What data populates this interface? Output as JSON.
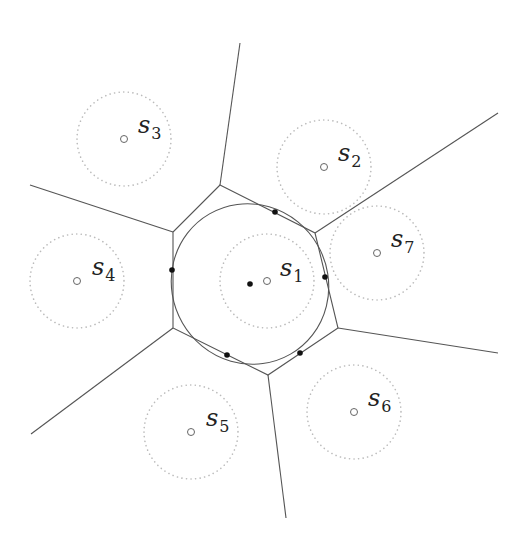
{
  "diagram": {
    "type": "voronoi-cell-with-inscribed-ellipse",
    "colors": {
      "edge": "#555555",
      "dotted_circle": "#bbbbbb",
      "site": "#666666",
      "tangent_point": "#111111"
    },
    "hexagon_vertices": [
      [
        220,
        185
      ],
      [
        315,
        233
      ],
      [
        338,
        328
      ],
      [
        268,
        375
      ],
      [
        173,
        328
      ],
      [
        173,
        232
      ]
    ],
    "rays": [
      {
        "from": [
          220,
          185
        ],
        "to": [
          240,
          43
        ]
      },
      {
        "from": [
          315,
          233
        ],
        "to": [
          498,
          113
        ]
      },
      {
        "from": [
          338,
          328
        ],
        "to": [
          498,
          353
        ]
      },
      {
        "from": [
          268,
          375
        ],
        "to": [
          286,
          518
        ]
      },
      {
        "from": [
          173,
          328
        ],
        "to": [
          31,
          434
        ]
      },
      {
        "from": [
          173,
          232
        ],
        "to": [
          30,
          185
        ]
      }
    ],
    "inscribed_ellipse": {
      "cx": 250,
      "cy": 284,
      "rx": 78,
      "ry": 81,
      "rotate": -30
    },
    "center_point": [
      250,
      284
    ],
    "tangent_points": [
      [
        275,
        212
      ],
      [
        172,
        270
      ],
      [
        325,
        277
      ],
      [
        227,
        355
      ],
      [
        300,
        353
      ]
    ],
    "sites": [
      {
        "name": "s",
        "sub": "1",
        "x": 267,
        "y": 281,
        "r": 47,
        "lx": 280,
        "ly": 276
      },
      {
        "name": "s",
        "sub": "2",
        "x": 324,
        "y": 167,
        "r": 47,
        "lx": 338,
        "ly": 161
      },
      {
        "name": "s",
        "sub": "3",
        "x": 124,
        "y": 139,
        "r": 47,
        "lx": 138,
        "ly": 133
      },
      {
        "name": "s",
        "sub": "4",
        "x": 77,
        "y": 281,
        "r": 47,
        "lx": 92,
        "ly": 275
      },
      {
        "name": "s",
        "sub": "5",
        "x": 191,
        "y": 432,
        "r": 47,
        "lx": 206,
        "ly": 426
      },
      {
        "name": "s",
        "sub": "6",
        "x": 354,
        "y": 412,
        "r": 47,
        "lx": 368,
        "ly": 406
      },
      {
        "name": "s",
        "sub": "7",
        "x": 377,
        "y": 253,
        "r": 47,
        "lx": 391,
        "ly": 247
      }
    ]
  }
}
